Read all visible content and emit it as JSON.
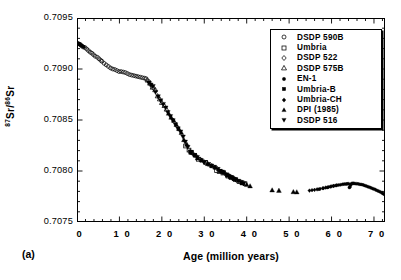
{
  "figure": {
    "panel_label": "(a)"
  },
  "chart_data": {
    "type": "scatter",
    "title": "",
    "xlabel": "Age (million years)",
    "ylabel": "87Sr/86Sr",
    "ylabel_parts": {
      "sup1": "87",
      "mid": "Sr/",
      "sup2": "86",
      "tail": "Sr"
    },
    "xlim": [
      0,
      72.6
    ],
    "ylim": [
      0.7075,
      0.7095
    ],
    "grid": false,
    "xticks": [
      0,
      10,
      20,
      30,
      40,
      50,
      60,
      70
    ],
    "xticklabels": [
      "0",
      "1 0",
      "2 0",
      "3 0",
      "4 0",
      "5 0",
      "6 0",
      "7 0"
    ],
    "yticks": [
      0.7075,
      0.708,
      0.7085,
      0.709,
      0.7095
    ],
    "yticklabels": [
      "0.7075",
      "0.7080",
      "0.7085",
      "0.7090",
      "0.7095"
    ],
    "xminor_interval": 2,
    "yminor_interval": 0.0001,
    "legend_position": "upper right",
    "marker_color": "#000000",
    "series": [
      {
        "name": "DSDP  590B",
        "marker": "circle-open",
        "points": [
          [
            0.2,
            0.70925
          ],
          [
            0.5,
            0.709245
          ],
          [
            0.8,
            0.70924
          ],
          [
            1.1,
            0.709225
          ],
          [
            1.5,
            0.709215
          ],
          [
            1.9,
            0.70921
          ],
          [
            2.3,
            0.709195
          ],
          [
            2.7,
            0.70918
          ],
          [
            3.1,
            0.709165
          ],
          [
            3.5,
            0.709155
          ],
          [
            3.9,
            0.70914
          ],
          [
            4.3,
            0.709125
          ],
          [
            4.8,
            0.709115
          ],
          [
            5.2,
            0.7091
          ],
          [
            5.6,
            0.709085
          ],
          [
            5.9,
            0.709075
          ],
          [
            6.4,
            0.709055
          ],
          [
            6.9,
            0.70904
          ],
          [
            7.4,
            0.709025
          ],
          [
            7.9,
            0.70901
          ],
          [
            8.4,
            0.709
          ],
          [
            8.9,
            0.708995
          ],
          [
            9.4,
            0.708985
          ],
          [
            9.9,
            0.708975
          ],
          [
            10.4,
            0.708975
          ],
          [
            10.9,
            0.70897
          ],
          [
            11.4,
            0.708965
          ],
          [
            11.9,
            0.708955
          ],
          [
            12.4,
            0.708945
          ],
          [
            12.9,
            0.70894
          ],
          [
            13.4,
            0.708935
          ],
          [
            13.9,
            0.70893
          ],
          [
            14.4,
            0.708925
          ],
          [
            14.9,
            0.70892
          ],
          [
            15.4,
            0.708915
          ],
          [
            15.9,
            0.70891
          ],
          [
            16.3,
            0.708905
          ]
        ]
      },
      {
        "name": "Umbria",
        "marker": "square-open",
        "points": [
          [
            25.6,
            0.708245
          ],
          [
            26.4,
            0.708205
          ],
          [
            27.0,
            0.70818
          ],
          [
            28.6,
            0.708115
          ],
          [
            30.3,
            0.708085
          ],
          [
            32.9,
            0.708005
          ],
          [
            33.5,
            0.707995
          ],
          [
            34.4,
            0.70798
          ],
          [
            35.6,
            0.70795
          ],
          [
            36.4,
            0.707935
          ],
          [
            37.3,
            0.707915
          ],
          [
            38.2,
            0.707895
          ],
          [
            38.9,
            0.707885
          ],
          [
            39.6,
            0.707875
          ]
        ]
      },
      {
        "name": "DSDP  522",
        "marker": "diamond-open",
        "points": [
          [
            17.0,
            0.708875
          ],
          [
            17.6,
            0.708835
          ],
          [
            18.1,
            0.70881
          ],
          [
            26.6,
            0.708195
          ],
          [
            27.4,
            0.708165
          ],
          [
            28.1,
            0.708145
          ],
          [
            29.0,
            0.708115
          ],
          [
            29.8,
            0.708095
          ],
          [
            30.6,
            0.70808
          ],
          [
            31.4,
            0.70806
          ],
          [
            32.1,
            0.708045
          ],
          [
            33.0,
            0.708025
          ],
          [
            34.0,
            0.707995
          ],
          [
            35.0,
            0.70797
          ],
          [
            36.0,
            0.707945
          ],
          [
            36.8,
            0.70793
          ],
          [
            37.6,
            0.70791
          ]
        ]
      },
      {
        "name": "DSDP  575B",
        "marker": "triangle-up-open",
        "points": [
          [
            16.6,
            0.70889
          ],
          [
            17.2,
            0.70886
          ],
          [
            17.8,
            0.70882
          ],
          [
            18.4,
            0.708795
          ],
          [
            19.0,
            0.708735
          ],
          [
            19.5,
            0.708705
          ],
          [
            20.0,
            0.70867
          ],
          [
            20.6,
            0.70864
          ],
          [
            21.1,
            0.708605
          ]
        ]
      },
      {
        "name": "EN-1",
        "marker": "circle-filled",
        "points": [
          [
            0.1,
            0.709255
          ],
          [
            0.25,
            0.70925
          ],
          [
            0.4,
            0.709248
          ],
          [
            0.55,
            0.709245
          ],
          [
            0.7,
            0.70924
          ],
          [
            0.85,
            0.709235
          ],
          [
            1.0,
            0.709232
          ],
          [
            1.2,
            0.709228
          ],
          [
            1.4,
            0.709222
          ],
          [
            1.6,
            0.709218
          ],
          [
            57.0,
            0.707822
          ],
          [
            58.0,
            0.70783
          ],
          [
            59.0,
            0.707838
          ],
          [
            59.7,
            0.707845
          ],
          [
            60.4,
            0.707852
          ],
          [
            61.0,
            0.707858
          ],
          [
            61.6,
            0.707862
          ],
          [
            62.1,
            0.707865
          ],
          [
            62.6,
            0.70787
          ],
          [
            63.0,
            0.707872
          ],
          [
            63.4,
            0.707873
          ],
          [
            63.7,
            0.707874
          ],
          [
            64.0,
            0.707875
          ],
          [
            64.2,
            0.707838
          ],
          [
            64.35,
            0.707845
          ],
          [
            64.5,
            0.707865
          ],
          [
            64.7,
            0.707876
          ],
          [
            64.9,
            0.707878
          ],
          [
            65.1,
            0.707879
          ],
          [
            65.4,
            0.707878
          ],
          [
            65.8,
            0.707876
          ],
          [
            66.2,
            0.707874
          ],
          [
            66.6,
            0.707871
          ],
          [
            67.0,
            0.707868
          ],
          [
            67.4,
            0.707864
          ],
          [
            67.8,
            0.707858
          ],
          [
            68.2,
            0.707852
          ],
          [
            68.6,
            0.707846
          ],
          [
            69.0,
            0.70784
          ],
          [
            69.4,
            0.707833
          ],
          [
            69.8,
            0.707826
          ],
          [
            70.2,
            0.70782
          ],
          [
            70.6,
            0.707812
          ],
          [
            71.0,
            0.707805
          ],
          [
            71.4,
            0.707797
          ],
          [
            71.8,
            0.707788
          ],
          [
            72.1,
            0.70778
          ],
          [
            72.4,
            0.707772
          ]
        ]
      },
      {
        "name": "Umbria-B",
        "marker": "square-filled",
        "points": [
          [
            26.8,
            0.708185
          ],
          [
            27.8,
            0.708155
          ],
          [
            33.8,
            0.708
          ],
          [
            34.6,
            0.707985
          ],
          [
            35.4,
            0.707958
          ],
          [
            36.2,
            0.70794
          ],
          [
            37.0,
            0.707922
          ]
        ]
      },
      {
        "name": "Umbria-CH",
        "marker": "diamond-filled",
        "points": [
          [
            54.8,
            0.707808
          ],
          [
            55.4,
            0.707812
          ],
          [
            56.0,
            0.707815
          ],
          [
            56.6,
            0.70782
          ],
          [
            57.3,
            0.707825
          ],
          [
            58.0,
            0.707832
          ],
          [
            58.6,
            0.707838
          ],
          [
            59.2,
            0.707843
          ],
          [
            59.9,
            0.70785
          ],
          [
            60.5,
            0.707855
          ],
          [
            61.2,
            0.70786
          ]
        ]
      },
      {
        "name": "DPI  (1985)",
        "marker": "triangle-up-filled",
        "points": [
          [
            21.6,
            0.708565
          ],
          [
            22.2,
            0.708525
          ],
          [
            22.8,
            0.708495
          ],
          [
            23.4,
            0.708455
          ],
          [
            24.0,
            0.708415
          ],
          [
            24.6,
            0.708375
          ],
          [
            25.2,
            0.708305
          ],
          [
            25.9,
            0.70826
          ],
          [
            28.4,
            0.708125
          ],
          [
            29.4,
            0.708105
          ],
          [
            30.8,
            0.70807
          ],
          [
            31.8,
            0.70805
          ],
          [
            32.6,
            0.708035
          ],
          [
            39.0,
            0.70788
          ],
          [
            40.0,
            0.707865
          ],
          [
            40.8,
            0.707852
          ],
          [
            46.0,
            0.707812
          ],
          [
            47.6,
            0.707808
          ],
          [
            51.0,
            0.707795
          ],
          [
            51.8,
            0.707793
          ]
        ]
      },
      {
        "name": "DSDP  516",
        "marker": "triangle-down-filled",
        "points": [
          [
            16.9,
            0.708865
          ],
          [
            17.4,
            0.708845
          ],
          [
            17.9,
            0.70883
          ],
          [
            18.5,
            0.708775
          ],
          [
            19.1,
            0.70873
          ],
          [
            19.7,
            0.70869
          ],
          [
            20.3,
            0.708655
          ],
          [
            20.9,
            0.70862
          ],
          [
            21.4,
            0.708575
          ],
          [
            22.0,
            0.708535
          ],
          [
            22.6,
            0.708495
          ],
          [
            23.2,
            0.708455
          ],
          [
            23.8,
            0.708415
          ],
          [
            24.4,
            0.708385
          ],
          [
            25.0,
            0.708335
          ],
          [
            25.5,
            0.708285
          ],
          [
            26.1,
            0.708235
          ],
          [
            26.9,
            0.708185
          ],
          [
            27.6,
            0.708155
          ],
          [
            28.3,
            0.708135
          ],
          [
            29.2,
            0.708105
          ],
          [
            30.0,
            0.708085
          ],
          [
            30.9,
            0.708065
          ],
          [
            31.6,
            0.708052
          ],
          [
            32.4,
            0.708038
          ],
          [
            33.2,
            0.708018
          ],
          [
            34.2,
            0.707992
          ],
          [
            35.2,
            0.707965
          ],
          [
            35.8,
            0.707948
          ],
          [
            36.6,
            0.707932
          ],
          [
            37.4,
            0.707915
          ],
          [
            38.0,
            0.707902
          ],
          [
            38.6,
            0.70789
          ],
          [
            39.3,
            0.707878
          ]
        ]
      }
    ]
  },
  "legend": {
    "entries": [
      {
        "label": "DSDP  590B",
        "marker": "circle-open"
      },
      {
        "label": "Umbria",
        "marker": "square-open"
      },
      {
        "label": "DSDP  522",
        "marker": "diamond-open"
      },
      {
        "label": "DSDP  575B",
        "marker": "triangle-up-open"
      },
      {
        "label": "EN-1",
        "marker": "circle-filled"
      },
      {
        "label": "Umbria-B",
        "marker": "square-filled"
      },
      {
        "label": "Umbria-CH",
        "marker": "diamond-filled"
      },
      {
        "label": "DPI  (1985)",
        "marker": "triangle-up-filled"
      },
      {
        "label": "DSDP  516",
        "marker": "triangle-down-filled"
      }
    ]
  }
}
